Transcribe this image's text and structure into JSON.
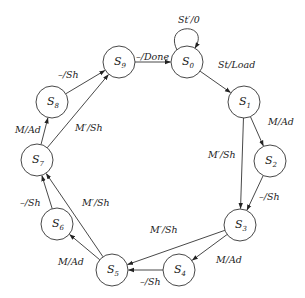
{
  "diagram": {
    "type": "state-machine",
    "states": [
      {
        "id": "S0",
        "name": "S",
        "sub": "0",
        "x": 187,
        "y": 62
      },
      {
        "id": "S1",
        "name": "S",
        "sub": "1",
        "x": 244,
        "y": 102
      },
      {
        "id": "S2",
        "name": "S",
        "sub": "2",
        "x": 270,
        "y": 161
      },
      {
        "id": "S3",
        "name": "S",
        "sub": "3",
        "x": 240,
        "y": 225
      },
      {
        "id": "S4",
        "name": "S",
        "sub": "4",
        "x": 179,
        "y": 270
      },
      {
        "id": "S5",
        "name": "S",
        "sub": "5",
        "x": 112,
        "y": 270
      },
      {
        "id": "S6",
        "name": "S",
        "sub": "6",
        "x": 57,
        "y": 224
      },
      {
        "id": "S7",
        "name": "S",
        "sub": "7",
        "x": 37,
        "y": 160
      },
      {
        "id": "S8",
        "name": "S",
        "sub": "8",
        "x": 52,
        "y": 102
      },
      {
        "id": "S9",
        "name": "S",
        "sub": "9",
        "x": 119,
        "y": 62
      }
    ],
    "transitions": [
      {
        "from": "S0",
        "to": "S0",
        "label": "St′/0",
        "lx": 178,
        "ly": 23
      },
      {
        "from": "S0",
        "to": "S1",
        "label": "St/Load",
        "lx": 218,
        "ly": 68
      },
      {
        "from": "S1",
        "to": "S2",
        "label": "M/Ad",
        "lx": 268,
        "ly": 125
      },
      {
        "from": "S1",
        "to": "S3",
        "label": "M′/Sh",
        "lx": 208,
        "ly": 158
      },
      {
        "from": "S2",
        "to": "S3",
        "label": "–/Sh",
        "lx": 259,
        "ly": 200
      },
      {
        "from": "S3",
        "to": "S4",
        "label": "M/Ad",
        "lx": 216,
        "ly": 263
      },
      {
        "from": "S3",
        "to": "S5",
        "label": "M′/Sh",
        "lx": 150,
        "ly": 233
      },
      {
        "from": "S4",
        "to": "S5",
        "label": "–/Sh",
        "lx": 140,
        "ly": 285
      },
      {
        "from": "S5",
        "to": "S6",
        "label": "M/Ad",
        "lx": 58,
        "ly": 265
      },
      {
        "from": "S5",
        "to": "S7",
        "label": "M′/Sh",
        "lx": 82,
        "ly": 206
      },
      {
        "from": "S6",
        "to": "S7",
        "label": "–/Sh",
        "lx": 20,
        "ly": 206
      },
      {
        "from": "S7",
        "to": "S8",
        "label": "M/Ad",
        "lx": 15,
        "ly": 133
      },
      {
        "from": "S7",
        "to": "S9",
        "label": "M′/Sh",
        "lx": 75,
        "ly": 131
      },
      {
        "from": "S8",
        "to": "S9",
        "label": "–/Sh",
        "lx": 58,
        "ly": 78
      },
      {
        "from": "S9",
        "to": "S0",
        "label": "–/Done",
        "lx": 136,
        "ly": 60
      }
    ]
  }
}
